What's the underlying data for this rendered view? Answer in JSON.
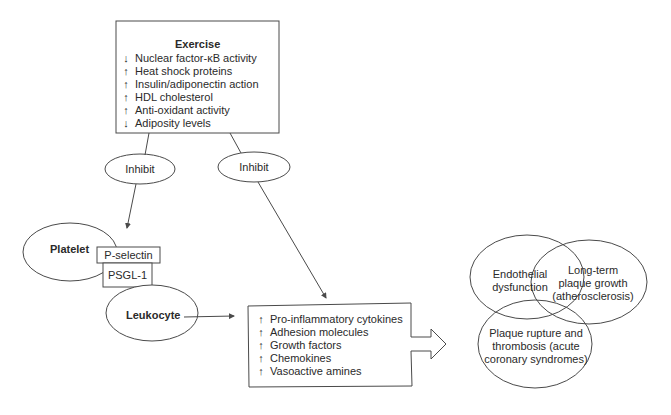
{
  "exercise": {
    "title": "Exercise",
    "items": [
      {
        "arrow": "↓",
        "label": "Nuclear factor-κB activity"
      },
      {
        "arrow": "↑",
        "label": "Heat shock proteins"
      },
      {
        "arrow": "↑",
        "label": "Insulin/adiponectin action"
      },
      {
        "arrow": "↑",
        "label": "HDL cholesterol"
      },
      {
        "arrow": "↑",
        "label": "Anti-oxidant activity"
      },
      {
        "arrow": "↓",
        "label": "Adiposity levels"
      }
    ]
  },
  "inhibit_left": {
    "label": "Inhibit"
  },
  "inhibit_right": {
    "label": "Inhibit"
  },
  "platelet": {
    "label": "Platelet"
  },
  "p_selectin": {
    "label": "P-selectin"
  },
  "psgl1": {
    "label": "PSGL-1"
  },
  "leukocyte": {
    "label": "Leukocyte"
  },
  "mediators": {
    "items": [
      {
        "arrow": "↑",
        "label": "Pro-inflammatory cytokines"
      },
      {
        "arrow": "↑",
        "label": "Adhesion molecules"
      },
      {
        "arrow": "↑",
        "label": "Growth factors"
      },
      {
        "arrow": "↑",
        "label": "Chemokines"
      },
      {
        "arrow": "↑",
        "label": "Vasoactive amines"
      }
    ]
  },
  "outcomes": {
    "endothelial": {
      "line1": "Endothelial",
      "line2": "dysfunction"
    },
    "plaque_growth": {
      "line1": "Long-term",
      "line2": "plaque growth",
      "line3": "(atherosclerosis)"
    },
    "plaque_rupture": {
      "line1": "Plaque rupture and",
      "line2": "thrombosis (acute",
      "line3": "coronary syndromes)"
    }
  },
  "colors": {
    "stroke": "#4a4a4a",
    "text": "#2a2a2a",
    "background": "#ffffff"
  }
}
